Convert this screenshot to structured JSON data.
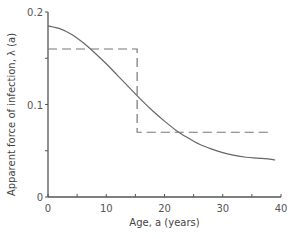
{
  "chart_data": {
    "type": "line",
    "title": "",
    "xlabel": "Age, a (years)",
    "ylabel": "Apparent force of infection, λ (a)",
    "xlim": [
      0,
      40
    ],
    "ylim": [
      0,
      0.2
    ],
    "xticks": [
      0,
      10,
      20,
      30,
      40
    ],
    "xtick_labels": [
      "0",
      "10",
      "20",
      "30",
      "40"
    ],
    "xminor_ticks": [
      5,
      15,
      25,
      35
    ],
    "yticks": [
      0,
      0.1,
      0.2
    ],
    "ytick_labels": [
      "0",
      "0.1",
      "0.2"
    ],
    "yminor_ticks": [
      0.05,
      0.15
    ],
    "grid": false,
    "legend": null,
    "series": [
      {
        "name": "smooth",
        "style": "solid",
        "color": "#666666",
        "x": [
          0,
          2,
          4,
          6,
          8,
          10,
          12,
          14,
          16,
          18,
          20,
          22,
          24,
          26,
          28,
          30,
          32,
          34,
          36,
          38,
          39
        ],
        "y": [
          0.185,
          0.182,
          0.176,
          0.167,
          0.156,
          0.144,
          0.131,
          0.118,
          0.105,
          0.093,
          0.082,
          0.072,
          0.064,
          0.057,
          0.052,
          0.048,
          0.045,
          0.043,
          0.042,
          0.041,
          0.04
        ]
      },
      {
        "name": "step",
        "style": "dashed",
        "color": "#777777",
        "x": [
          0,
          15.3,
          15.3,
          38.5
        ],
        "y": [
          0.16,
          0.16,
          0.07,
          0.07
        ]
      }
    ]
  }
}
